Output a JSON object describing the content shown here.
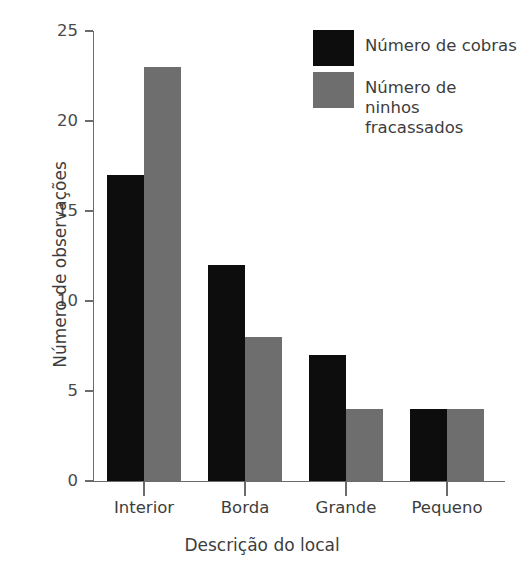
{
  "chart_data": {
    "type": "bar",
    "title": "",
    "xlabel": "Descrição do local",
    "ylabel": "Número de observações",
    "categories": [
      "Interior",
      "Borda",
      "Grande",
      "Pequeno"
    ],
    "series": [
      {
        "name": "Número de cobras",
        "color": "#0d0d0d",
        "values": [
          17,
          12,
          7,
          4
        ]
      },
      {
        "name": "Número de\nninhos fracassados",
        "color": "#6e6e6e",
        "values": [
          23,
          8,
          4,
          4
        ]
      }
    ],
    "ylim": [
      0,
      25
    ],
    "yticks": [
      0,
      5,
      10,
      15,
      20,
      25
    ],
    "ytick_labels": [
      "0",
      "5",
      "10",
      "15",
      "20",
      "25"
    ],
    "grid": false,
    "legend_position": "top-right",
    "axis_color": "#6b6b6b",
    "background": "#ffffff"
  },
  "legend": {
    "entries": [
      {
        "label": "Número de cobras",
        "color": "#0d0d0d"
      },
      {
        "label": "Número de\nninhos fracassados",
        "color": "#6e6e6e"
      }
    ]
  }
}
